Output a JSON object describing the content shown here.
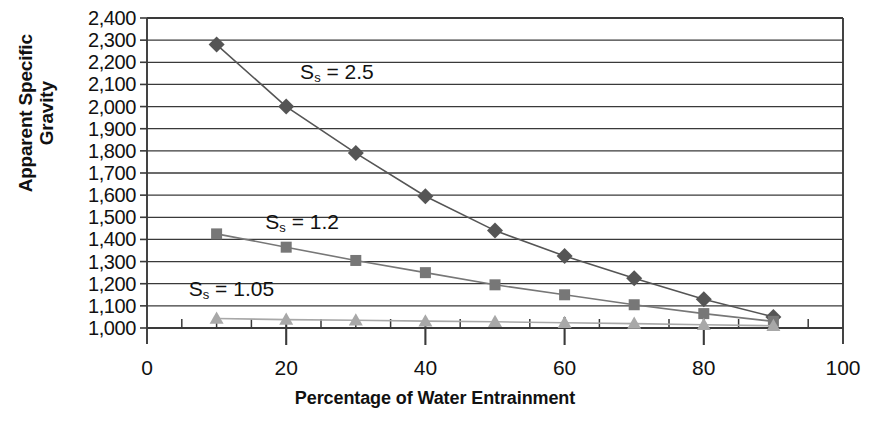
{
  "chart_data": {
    "type": "line",
    "title": "",
    "xlabel": "Percentage of Water Entrainment",
    "ylabel": "Apparent Specific\nGravity",
    "xlim": [
      0,
      100
    ],
    "ylim": [
      1000,
      2400
    ],
    "xticks": [
      0,
      20,
      40,
      60,
      80,
      100
    ],
    "xtick_labels": [
      "0",
      "20",
      "40",
      "60",
      "80",
      "100"
    ],
    "yticks": [
      1000,
      1100,
      1200,
      1300,
      1400,
      1500,
      1600,
      1700,
      1800,
      1900,
      2000,
      2100,
      2200,
      2300,
      2400
    ],
    "ytick_labels": [
      "1,000",
      "1,100",
      "1,200",
      "1,300",
      "1,400",
      "1,500",
      "1,600",
      "1,700",
      "1,800",
      "1,900",
      "2,000",
      "2,100",
      "2,200",
      "2,300",
      "2,400"
    ],
    "x_minor_tick_step": 5,
    "grid": "horizontal",
    "legend": "inline-annotations",
    "series": [
      {
        "name": "Ss = 2.5",
        "marker": "diamond",
        "color": "#555555",
        "x": [
          10,
          20,
          30,
          40,
          50,
          60,
          70,
          80,
          90
        ],
        "values": [
          2280,
          2000,
          1790,
          1595,
          1440,
          1325,
          1225,
          1130,
          1050
        ]
      },
      {
        "name": "Ss = 1.2",
        "marker": "square",
        "color": "#777777",
        "x": [
          10,
          20,
          30,
          40,
          50,
          60,
          70,
          80,
          90
        ],
        "values": [
          1425,
          1365,
          1305,
          1250,
          1195,
          1150,
          1105,
          1065,
          1030
        ]
      },
      {
        "name": "Ss = 1.05",
        "marker": "triangle",
        "color": "#a8a8a8",
        "x": [
          10,
          20,
          30,
          40,
          50,
          60,
          70,
          80,
          90
        ],
        "values": [
          1043,
          1038,
          1035,
          1031,
          1028,
          1024,
          1020,
          1015,
          1010
        ]
      }
    ],
    "annotations": [
      {
        "text": "Ss = 2.5",
        "label_prefix": "S",
        "label_sub": "s",
        "label_suffix": " = 2.5",
        "x": 22,
        "y": 2145
      },
      {
        "text": "Ss = 1.2",
        "label_prefix": "S",
        "label_sub": "s",
        "label_suffix": " = 1.2",
        "x": 17,
        "y": 1470
      },
      {
        "text": "Ss = 1.05",
        "label_prefix": "S",
        "label_sub": "s",
        "label_suffix": " = 1.05",
        "x": 6,
        "y": 1165
      }
    ],
    "colors": {
      "axis": "#3a3a3a",
      "grid": "#3a3a3a",
      "text": "#111111",
      "series_2_5": "#555555",
      "series_1_2": "#777777",
      "series_1_05": "#a8a8a8"
    }
  }
}
